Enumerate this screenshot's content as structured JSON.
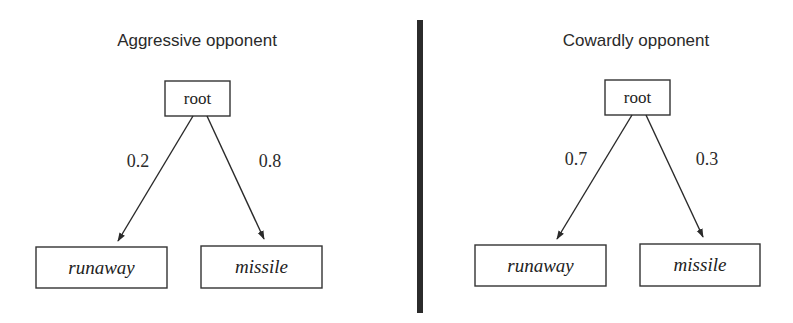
{
  "panels": [
    {
      "title": "Aggressive opponent",
      "root": {
        "label": "root"
      },
      "edges": [
        {
          "target": "runaway",
          "probability": "0.2"
        },
        {
          "target": "missile",
          "probability": "0.8"
        }
      ],
      "leaves": [
        {
          "label": "runaway"
        },
        {
          "label": "missile"
        }
      ]
    },
    {
      "title": "Cowardly opponent",
      "root": {
        "label": "root"
      },
      "edges": [
        {
          "target": "runaway",
          "probability": "0.7"
        },
        {
          "target": "missile",
          "probability": "0.3"
        }
      ],
      "leaves": [
        {
          "label": "runaway"
        },
        {
          "label": "missile"
        }
      ]
    }
  ],
  "colors": {
    "stroke": "#2a2a2a",
    "divider": "#2b2b2b",
    "background": "#ffffff"
  }
}
